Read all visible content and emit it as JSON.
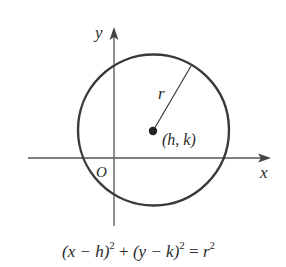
{
  "figure": {
    "axes": {
      "x_label": "x",
      "y_label": "y",
      "origin_label": "O"
    },
    "circle": {
      "center_label": "(h, k)",
      "radius_label": "r"
    },
    "equation": {
      "part1": "(x − h)",
      "exp1": "2",
      "plus": " + ",
      "part2": "(y − k)",
      "exp2": "2",
      "eq": " = ",
      "part3": "r",
      "exp3": "2"
    },
    "colors": {
      "stroke": "#3a3a3a",
      "axis": "#555555",
      "text": "#2a2a2a",
      "background": "#ffffff"
    }
  }
}
